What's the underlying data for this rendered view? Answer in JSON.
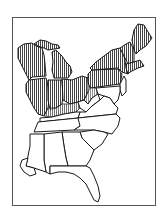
{
  "map": {
    "region": "Eastern United States",
    "style": "black and white line art",
    "legend": [],
    "colors": {
      "background": "#ffffff",
      "frame": "#555555",
      "outline": "#1a1a1a",
      "hatch": "#444444",
      "unshaded": "#ffffff"
    },
    "shaded_pattern": "vertical-hatch",
    "shaded_states": [
      "Wisconsin",
      "Michigan",
      "Illinois",
      "Indiana",
      "Ohio",
      "Pennsylvania",
      "New York",
      "Vermont",
      "New Hampshire",
      "Maine",
      "Massachusetts",
      "Connecticut",
      "Rhode Island",
      "northern Kentucky",
      "northern West Virginia"
    ],
    "unshaded_states": [
      "Kentucky (south)",
      "West Virginia (south)",
      "Virginia",
      "Maryland",
      "Delaware",
      "New Jersey",
      "Tennessee",
      "North Carolina",
      "South Carolina",
      "Georgia",
      "Alabama",
      "Mississippi",
      "Florida"
    ]
  }
}
